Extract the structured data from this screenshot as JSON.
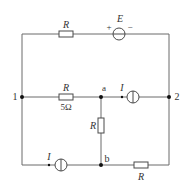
{
  "diagram": {
    "type": "circuit",
    "colors": {
      "wire": "#6b6b6b",
      "component": "#4a4a4a",
      "node": "#111111",
      "text": "#333333"
    },
    "components": {
      "top_resistor": {
        "label": "R"
      },
      "voltage_source": {
        "label": "E",
        "plus": "+",
        "minus": "−"
      },
      "middle_resistor": {
        "label": "R",
        "value": "5Ω"
      },
      "current_source_ab": {
        "label": "I"
      },
      "vertical_resistor": {
        "label": "R"
      },
      "current_source_bottom": {
        "label": "I"
      },
      "bottom_resistor": {
        "label": "R"
      }
    },
    "nodes": {
      "n1": "1",
      "n2": "2",
      "a": "a",
      "b": "b"
    }
  }
}
